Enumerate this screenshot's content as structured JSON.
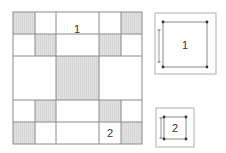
{
  "diagram": {
    "grid": {
      "x_lines": [
        13,
        35,
        56,
        99,
        121,
        142
      ],
      "y_lines": [
        12,
        34,
        56,
        100,
        122,
        144
      ],
      "shaded_cells": [
        [
          0,
          0
        ],
        [
          1,
          1
        ],
        [
          0,
          4
        ],
        [
          1,
          3
        ],
        [
          2,
          2
        ],
        [
          3,
          1
        ],
        [
          4,
          0
        ],
        [
          3,
          3
        ],
        [
          4,
          4
        ]
      ],
      "labels": [
        {
          "text": "1",
          "x": 77,
          "y": 33
        },
        {
          "text": "2",
          "x": 110,
          "y": 137
        }
      ]
    },
    "figure1": {
      "label": "1",
      "outer": {
        "x": 155,
        "y": 13,
        "w": 61,
        "h": 61
      },
      "inner": {
        "x": 163,
        "y": 22,
        "w": 44,
        "h": 45
      },
      "dim_line": {
        "x": 159,
        "y1": 30,
        "y2": 62
      }
    },
    "figure2": {
      "label": "2",
      "outer": {
        "x": 156,
        "y": 108,
        "w": 38,
        "h": 39
      },
      "inner": {
        "x": 164,
        "y": 117,
        "w": 22,
        "h": 22
      },
      "dim_line": {
        "x": 161,
        "y1": 118,
        "y2": 138
      }
    },
    "colors": {
      "line": "#8a8a8a",
      "shade": "#dedede",
      "dot": "#333333"
    }
  }
}
